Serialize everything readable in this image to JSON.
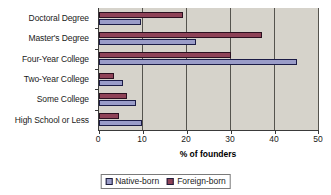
{
  "chart_data": {
    "type": "bar",
    "orientation": "horizontal",
    "title": "",
    "xlabel": "% of founders",
    "ylabel": "",
    "xlim": [
      0,
      50
    ],
    "xticks": [
      0,
      10,
      20,
      30,
      40,
      50
    ],
    "xtick_labels": [
      "0",
      "10",
      "20",
      "30",
      "40",
      "50"
    ],
    "grid": true,
    "grid_axis": "x",
    "legend_position": "bottom-center",
    "categories": [
      "Doctoral Degree",
      "Master's Degree",
      "Four-Year College",
      "Two-Year College",
      "Some College",
      "High School or Less"
    ],
    "series": [
      {
        "name": "Native-born",
        "color": "#9a9cc8",
        "values": [
          9.5,
          22.0,
          45.0,
          5.5,
          8.5,
          9.7
        ]
      },
      {
        "name": "Foreign-born",
        "color": "#8e4257",
        "values": [
          19.0,
          37.0,
          30.0,
          3.4,
          6.3,
          4.5
        ]
      }
    ]
  },
  "legend": {
    "entries": [
      {
        "label": "Native-born",
        "swatch": "native-born-swatch"
      },
      {
        "label": "Foreign-born",
        "swatch": "foreign-born-swatch"
      }
    ]
  },
  "colors": {
    "native_born": "#9a9cc8",
    "foreign_born": "#8e4257",
    "plot_background": "#d6d3cb",
    "gridline": "#55534e",
    "axis": "#3a3a3a",
    "page_background": "#ffffff"
  }
}
